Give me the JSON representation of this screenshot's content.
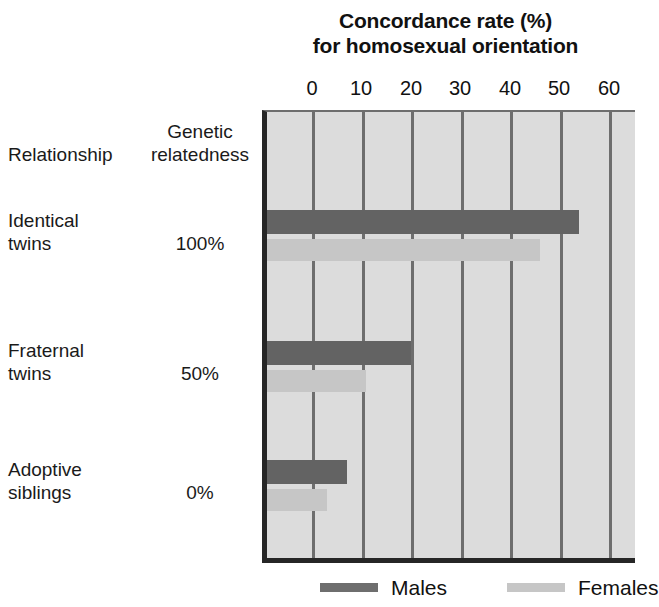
{
  "chart_data": {
    "type": "bar",
    "orientation": "horizontal",
    "title": "Concordance rate (%) for homosexual orientation",
    "title_lines": [
      "Concordance rate (%)",
      "for homosexual orientation"
    ],
    "xlabel": "",
    "ylabel": "",
    "xlim": [
      0,
      62
    ],
    "xticks": [
      0,
      10,
      20,
      30,
      40,
      50,
      60
    ],
    "xtick_labels": [
      "0",
      "10",
      "20",
      "30",
      "40",
      "50",
      "60"
    ],
    "grid": true,
    "grid_axis": "x",
    "legend_position": "bottom",
    "categories": [
      "Identical twins",
      "Fraternal twins",
      "Adoptive siblings"
    ],
    "series": [
      {
        "name": "Males",
        "color": "#636363",
        "values": [
          54,
          20,
          7
        ]
      },
      {
        "name": "Females",
        "color": "#c6c6c6",
        "values": [
          46,
          11,
          3
        ]
      }
    ],
    "row_meta": [
      {
        "relationship_lines": [
          "Identical",
          "twins"
        ],
        "genetic_relatedness": "100%"
      },
      {
        "relationship_lines": [
          "Fraternal",
          "twins"
        ],
        "genetic_relatedness": "50%"
      },
      {
        "relationship_lines": [
          "Adoptive",
          "siblings"
        ],
        "genetic_relatedness": "0%"
      }
    ]
  },
  "columns": {
    "relationship_header": "Relationship",
    "genetic_header_lines": [
      "Genetic",
      "relatedness"
    ]
  },
  "rows": [
    {
      "relationship_line1": "Identical",
      "relationship_line2": "twins",
      "genetic": "100%",
      "male_value": 54,
      "female_value": 46
    },
    {
      "relationship_line1": "Fraternal",
      "relationship_line2": "twins",
      "genetic": "50%",
      "male_value": 20,
      "female_value": 11
    },
    {
      "relationship_line1": "Adoptive",
      "relationship_line2": "siblings",
      "genetic": "0%",
      "male_value": 7,
      "female_value": 3
    }
  ],
  "axis": {
    "tick0": "0",
    "tick1": "10",
    "tick2": "20",
    "tick3": "30",
    "tick4": "40",
    "tick5": "50",
    "tick6": "60"
  },
  "legend": {
    "males_label": "Males",
    "females_label": "Females"
  },
  "colors": {
    "male_bar": "#636363",
    "female_bar": "#c6c6c6",
    "plot_background": "#dcdcdc",
    "gridline": "#6e6e6e",
    "axis_border": "#262626"
  }
}
